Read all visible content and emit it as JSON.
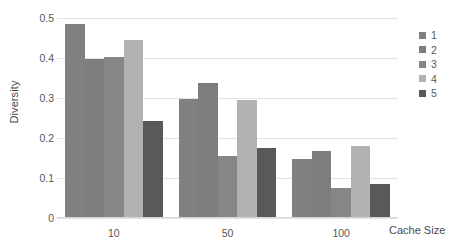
{
  "chart_data": {
    "type": "bar",
    "title": "",
    "xlabel": "Cache Size",
    "ylabel": "Diversity",
    "categories": [
      "10",
      "50",
      "100"
    ],
    "series": [
      {
        "name": "1",
        "color": "#808080",
        "values": [
          0.485,
          0.298,
          0.147
        ]
      },
      {
        "name": "2",
        "color": "#7d7d7d",
        "values": [
          0.398,
          0.338,
          0.168
        ]
      },
      {
        "name": "3",
        "color": "#868686",
        "values": [
          0.403,
          0.156,
          0.074
        ]
      },
      {
        "name": "4",
        "color": "#b2b2b2",
        "values": [
          0.445,
          0.294,
          0.18
        ]
      },
      {
        "name": "5",
        "color": "#595959",
        "values": [
          0.242,
          0.174,
          0.086
        ]
      }
    ],
    "ylim": [
      0,
      0.5
    ],
    "y_ticks": [
      "0.5",
      "0.4",
      "0.3",
      "0.2",
      "0.1",
      "0"
    ],
    "y_tick_values": [
      0.5,
      0.4,
      0.3,
      0.2,
      0.1,
      0
    ],
    "grid": true,
    "legend_position": "right",
    "legend_entries": [
      "1",
      "2",
      "3",
      "4",
      "5"
    ]
  },
  "axes": {
    "y_title": "Diversity",
    "x_title": "Cache Size"
  },
  "colors": {
    "gridline": "#e2e2e2",
    "axis_text": "#585858",
    "title_text": "#4a4a4a",
    "background": "#ffffff"
  }
}
